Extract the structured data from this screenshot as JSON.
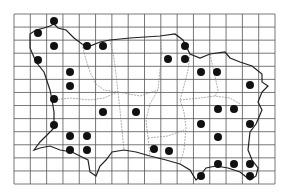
{
  "map": {
    "type": "distribution-grid-map",
    "grid": {
      "left": 14,
      "top": 14,
      "right": 275,
      "bottom": 184,
      "cols": 16,
      "rows": 13,
      "line_color": "#555555"
    },
    "dot_color": "#111111",
    "dot_radius": 4,
    "dots": [
      [
        54,
        21
      ],
      [
        38,
        33
      ],
      [
        54,
        46
      ],
      [
        38,
        60
      ],
      [
        70,
        72
      ],
      [
        70,
        86
      ],
      [
        87,
        46
      ],
      [
        103,
        46
      ],
      [
        185,
        46
      ],
      [
        168,
        59
      ],
      [
        185,
        59
      ],
      [
        201,
        72
      ],
      [
        217,
        72
      ],
      [
        250,
        85
      ],
      [
        54,
        99
      ],
      [
        103,
        112
      ],
      [
        136,
        112
      ],
      [
        54,
        125
      ],
      [
        70,
        136
      ],
      [
        87,
        136
      ],
      [
        70,
        150
      ],
      [
        87,
        150
      ],
      [
        218,
        109
      ],
      [
        234,
        109
      ],
      [
        201,
        124
      ],
      [
        250,
        124
      ],
      [
        218,
        137
      ],
      [
        154,
        149
      ],
      [
        169,
        151
      ],
      [
        218,
        164
      ],
      [
        234,
        164
      ],
      [
        250,
        164
      ],
      [
        201,
        176
      ],
      [
        250,
        176
      ]
    ]
  }
}
